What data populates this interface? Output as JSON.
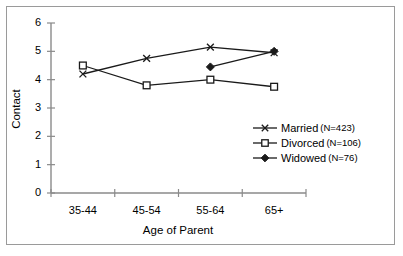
{
  "chart_data": {
    "type": "line",
    "title": "",
    "xlabel": "Age of Parent",
    "ylabel": "Contact",
    "categories": [
      "35-44",
      "45-54",
      "55-64",
      "65+"
    ],
    "ylim": [
      0,
      6
    ],
    "yticks": [
      0,
      1,
      2,
      3,
      4,
      5,
      6
    ],
    "ytick_labels": [
      "0",
      "1",
      "2",
      "3",
      "4",
      "5",
      "6"
    ],
    "grid": false,
    "legend_position": "center-right",
    "series": [
      {
        "name": "Married",
        "n": 423,
        "legend_label": "Married",
        "legend_n": "(N=423)",
        "marker": "x-cross",
        "color": "#000000",
        "values": [
          4.2,
          4.75,
          5.15,
          4.95
        ]
      },
      {
        "name": "Divorced",
        "n": 106,
        "legend_label": "Divorced",
        "legend_n": "(N=106)",
        "marker": "open-square",
        "color": "#000000",
        "values": [
          4.5,
          3.8,
          4.0,
          3.75
        ]
      },
      {
        "name": "Widowed",
        "n": 76,
        "legend_label": "Widowed",
        "legend_n": "(N=76)",
        "marker": "filled-diamond",
        "color": "#000000",
        "values": [
          null,
          null,
          4.45,
          5.0
        ]
      }
    ]
  },
  "axes": {
    "y_tick_labels": [
      "6",
      "5",
      "4",
      "3",
      "2",
      "1",
      "0"
    ],
    "x_tick_labels": [
      "35-44",
      "45-54",
      "55-64",
      "65+"
    ],
    "y_title": "Contact",
    "x_title": "Age of Parent"
  },
  "legend": {
    "entries": [
      {
        "label": "Married",
        "count": "(N=423)",
        "marker": "x-cross-marker-icon"
      },
      {
        "label": "Divorced",
        "count": "(N=106)",
        "marker": "open-square-marker-icon"
      },
      {
        "label": "Widowed",
        "count": "(N=76)",
        "marker": "filled-diamond-marker-icon"
      }
    ]
  },
  "colors": {
    "line": "#1a1a1a",
    "axis": "#8a8a8a",
    "frame": "#9a9a9a",
    "text": "#000000",
    "background": "#ffffff"
  }
}
